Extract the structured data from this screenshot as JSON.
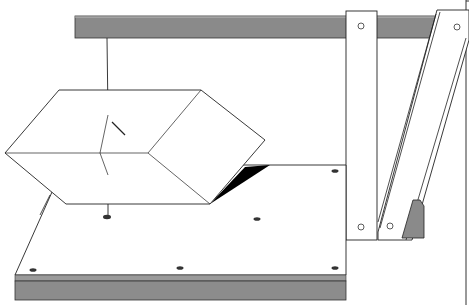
{
  "figure": {
    "colors": {
      "background": "#ffffff",
      "line": "#1a1a1a",
      "bar_gray": "#8a8a8a",
      "plate_edge_gray": "#8c8c8c",
      "shadow": "#000000"
    },
    "components": [
      {
        "name": "overhead-bar",
        "label": "Overhead bar"
      },
      {
        "name": "suspension-thread",
        "label": "Thread"
      },
      {
        "name": "rhombic-prism",
        "label": "Suspended prism"
      },
      {
        "name": "base-plate",
        "label": "Base plate"
      },
      {
        "name": "upright-post",
        "label": "Upright post"
      },
      {
        "name": "diagonal-brace",
        "label": "Diagonal brace"
      },
      {
        "name": "support-block",
        "label": "Support block"
      }
    ],
    "base_plate_holes": 7,
    "post_holes": 4
  }
}
